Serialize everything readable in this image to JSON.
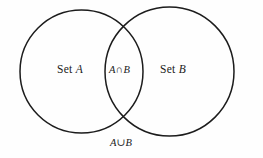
{
  "figure": {
    "name": "venn-diagram",
    "type": "venn-two-set",
    "background_color": "#fefefe",
    "stroke_color": "#1c1c1c",
    "labels": {
      "set_a": {
        "prefix": "Set ",
        "variable": "A"
      },
      "set_b": {
        "prefix": "Set ",
        "variable": "B"
      },
      "intersection": "A∩B",
      "union": "A∪B"
    },
    "circles": [
      {
        "name": "circle-set-a",
        "cx": 81.5,
        "cy": 71.5,
        "r": 61.5
      },
      {
        "name": "circle-set-b",
        "cx": 169.5,
        "cy": 71.5,
        "r": 64.5
      }
    ]
  }
}
